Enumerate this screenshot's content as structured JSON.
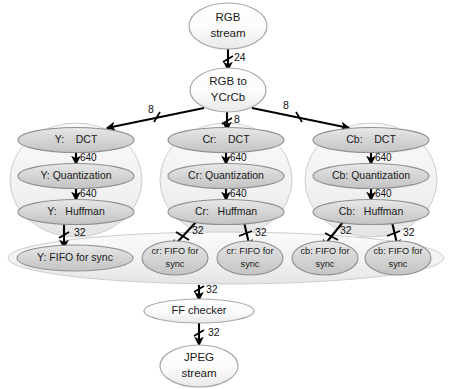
{
  "diagram": {
    "colors": {
      "node_fill_light": "#f4f4f4",
      "node_fill_grey": "#d2d2d2",
      "node_stroke": "#9a9a9a",
      "group_fill": "#f2f2f2",
      "group_stroke": "#c8c8c8",
      "edge_stroke": "#000000",
      "text": "#1a1a1a"
    },
    "nodes": {
      "rgb_stream": {
        "line1": "RGB",
        "line2": "stream"
      },
      "rgb_to_ycrcb": {
        "line1": "RGB to",
        "line2": "YCrCb"
      },
      "y_dct": "Y:    DCT",
      "y_quant": "Y: Quantization",
      "y_huffman": "Y:   Huffman",
      "cr_dct": "Cr:    DCT",
      "cr_quant": "Cr: Quantization",
      "cr_huffman": "Cr:   Huffman",
      "cb_dct": "Cb:    DCT",
      "cb_quant": "Cb: Quantization",
      "cb_huffman": "Cb:   Huffman",
      "y_fifo": "Y: FIFO for sync",
      "cr_fifo_1": {
        "line1": "cr: FIFO for",
        "line2": "sync"
      },
      "cr_fifo_2": {
        "line1": "cr: FIFO for",
        "line2": "sync"
      },
      "cb_fifo_1": {
        "line1": "cb: FIFO for",
        "line2": "sync"
      },
      "cb_fifo_2": {
        "line1": "cb: FIFO for",
        "line2": "sync"
      },
      "ff_checker": "FF checker",
      "jpeg_stream": {
        "line1": "JPEG",
        "line2": "stream"
      }
    },
    "edge_labels": {
      "rgb_to_convert": "24",
      "convert_to_y": "8",
      "convert_to_cr": "8",
      "convert_to_cb": "8",
      "y_dct_to_quant": "640",
      "y_quant_to_huffman": "640",
      "cr_dct_to_quant": "640",
      "cr_quant_to_huffman": "640",
      "cb_dct_to_quant": "640",
      "cb_quant_to_huffman": "640",
      "y_huffman_to_fifo": "32",
      "cr_huffman_to_fifo1": "32",
      "cr_huffman_to_fifo2": "32",
      "cb_huffman_to_fifo1": "32",
      "cb_huffman_to_fifo2": "32",
      "fifo_to_ff": "32",
      "ff_to_jpeg": "32"
    }
  }
}
